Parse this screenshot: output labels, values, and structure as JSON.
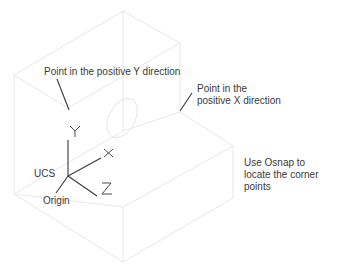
{
  "diagram": {
    "colors": {
      "edges": "#e4e4e4",
      "ink": "#3a3a3a"
    },
    "labels": {
      "positive_y": "Point in the positive Y direction",
      "positive_x": "Point in the\npositive X direction",
      "osnap": "Use Osnap to\nlocate the corner\npoints",
      "ucs": "UCS",
      "origin": "Origin"
    },
    "axes": [
      {
        "name": "Y",
        "glyph": "Y"
      },
      {
        "name": "X",
        "glyph": "X"
      },
      {
        "name": "Z",
        "glyph": "Z"
      }
    ]
  }
}
